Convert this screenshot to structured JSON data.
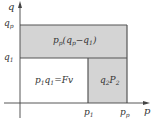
{
  "diagram": {
    "type": "area-decomposition",
    "axes": {
      "x_label": "p",
      "y_label": "q"
    },
    "x_ticks": [
      {
        "base": "p",
        "sub": "1"
      },
      {
        "base": "p",
        "sub": "p"
      }
    ],
    "y_ticks": [
      {
        "base": "q",
        "sub": "p"
      },
      {
        "base": "q",
        "sub": "1"
      }
    ],
    "regions": [
      {
        "id": "top-band",
        "label_parts": [
          {
            "base": "p",
            "sub": "p"
          },
          {
            "text": "("
          },
          {
            "base": "q",
            "sub": "p"
          },
          {
            "text": "−"
          },
          {
            "base": "q",
            "sub": "1"
          },
          {
            "text": ")"
          }
        ],
        "label": "p_p(q_p−q_1)",
        "shaded": true
      },
      {
        "id": "lower-left",
        "label": "p_1 q_1 = Fv",
        "shaded": false
      },
      {
        "id": "lower-right",
        "label": "q_2 P_2",
        "shaded": true
      }
    ],
    "colors": {
      "shade": "#d4d4d4",
      "line": "#555555",
      "axis": "#444444",
      "text": "#333333"
    }
  },
  "labels": {
    "axis_q": "q",
    "axis_p": "p",
    "qp_base": "q",
    "qp_sub": "p",
    "q1_base": "q",
    "q1_sub": "1",
    "p1_base": "p",
    "p1_sub": "1",
    "pp_base": "p",
    "pp_sub": "p",
    "top_p_base": "p",
    "top_p_sub": "p",
    "top_open": "(",
    "top_q_base": "q",
    "top_q_sub": "p",
    "top_minus": "−",
    "top_q1_base": "q",
    "top_q1_sub": "1",
    "top_close": ")",
    "ll_p_base": "p",
    "ll_p_sub": "1",
    "ll_q_base": "q",
    "ll_q_sub": "1",
    "ll_eq": "=Fv",
    "lr_q_base": "q",
    "lr_q_sub": "2",
    "lr_p_base": "P",
    "lr_p_sub": "2"
  }
}
